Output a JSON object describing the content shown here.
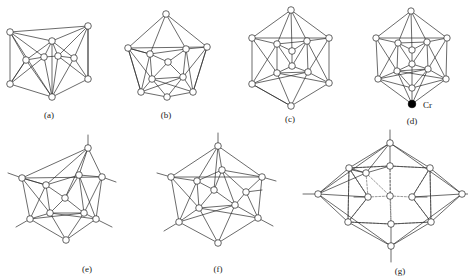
{
  "figure": {
    "kind": "polyhedral-cluster-diagram-set",
    "background_color": "#ffffff",
    "line_color": "#2b2b2b",
    "node_fill": "#ffffff",
    "node_stroke": "#222222",
    "filled_node_color": "#000000",
    "panels": [
      {
        "id": "a",
        "caption": "(a)",
        "caption_x": 49,
        "caption_y": 118,
        "vertex_count": 10,
        "has_exo_bonds": false,
        "has_dashed_bonds": false,
        "nodes": [
          {
            "x": 10,
            "y": 32,
            "r": 3.3,
            "filled": false
          },
          {
            "x": 88,
            "y": 26,
            "r": 3.3,
            "filled": false
          },
          {
            "x": 10,
            "y": 84,
            "r": 3.3,
            "filled": false
          },
          {
            "x": 88,
            "y": 79,
            "r": 3.3,
            "filled": false
          },
          {
            "x": 52,
            "y": 41,
            "r": 3.3,
            "filled": false
          },
          {
            "x": 52,
            "y": 97,
            "r": 3.3,
            "filled": false
          },
          {
            "x": 26,
            "y": 60,
            "r": 3.3,
            "filled": false
          },
          {
            "x": 74,
            "y": 58,
            "r": 3.3,
            "filled": false
          },
          {
            "x": 44,
            "y": 57,
            "r": 3.3,
            "filled": false
          },
          {
            "x": 58,
            "y": 56,
            "r": 3.3,
            "filled": false
          }
        ]
      },
      {
        "id": "b",
        "caption": "(b)",
        "caption_x": 166,
        "caption_y": 118,
        "vertex_count": 11,
        "has_exo_bonds": false,
        "has_dashed_bonds": false,
        "nodes": [
          {
            "x": 166,
            "y": 14,
            "r": 3.3,
            "filled": false
          },
          {
            "x": 128,
            "y": 48,
            "r": 3.3,
            "filled": false
          },
          {
            "x": 207,
            "y": 47,
            "r": 3.3,
            "filled": false
          },
          {
            "x": 141,
            "y": 92,
            "r": 3.3,
            "filled": false
          },
          {
            "x": 193,
            "y": 92,
            "r": 3.3,
            "filled": false
          },
          {
            "x": 150,
            "y": 54,
            "r": 3.3,
            "filled": false
          },
          {
            "x": 186,
            "y": 49,
            "r": 3.3,
            "filled": false
          },
          {
            "x": 152,
            "y": 79,
            "r": 3.3,
            "filled": false
          },
          {
            "x": 183,
            "y": 77,
            "r": 3.3,
            "filled": false
          },
          {
            "x": 168,
            "y": 62,
            "r": 3.3,
            "filled": false
          },
          {
            "x": 167,
            "y": 97,
            "r": 3.3,
            "filled": false
          }
        ]
      },
      {
        "id": "c",
        "caption": "(c)",
        "caption_x": 290,
        "caption_y": 122,
        "vertex_count": 12,
        "has_exo_bonds": false,
        "has_dashed_bonds": false,
        "nodes": [
          {
            "x": 291,
            "y": 10,
            "r": 3.3,
            "filled": false
          },
          {
            "x": 252,
            "y": 38,
            "r": 3.3,
            "filled": false
          },
          {
            "x": 329,
            "y": 38,
            "r": 3.3,
            "filled": false
          },
          {
            "x": 252,
            "y": 84,
            "r": 3.3,
            "filled": false
          },
          {
            "x": 329,
            "y": 83,
            "r": 3.3,
            "filled": false
          },
          {
            "x": 291,
            "y": 106,
            "r": 3.3,
            "filled": false
          },
          {
            "x": 277,
            "y": 44,
            "r": 3.3,
            "filled": false
          },
          {
            "x": 307,
            "y": 41,
            "r": 3.3,
            "filled": false
          },
          {
            "x": 277,
            "y": 73,
            "r": 3.3,
            "filled": false
          },
          {
            "x": 308,
            "y": 72,
            "r": 3.3,
            "filled": false
          },
          {
            "x": 292,
            "y": 51,
            "r": 3.3,
            "filled": false
          },
          {
            "x": 292,
            "y": 66,
            "r": 3.3,
            "filled": false
          }
        ]
      },
      {
        "id": "d",
        "caption": "(d)",
        "caption_x": 412,
        "caption_y": 124,
        "vertex_count": 12,
        "has_exo_bonds": false,
        "has_dashed_bonds": false,
        "metal_label": "Cr",
        "metal_label_x": 423,
        "metal_label_y": 108,
        "metal_node": {
          "x": 412,
          "y": 104,
          "r": 3.8,
          "filled": true
        },
        "nodes": [
          {
            "x": 411,
            "y": 11,
            "r": 3.2,
            "filled": false
          },
          {
            "x": 376,
            "y": 38,
            "r": 3.2,
            "filled": false
          },
          {
            "x": 447,
            "y": 38,
            "r": 3.2,
            "filled": false
          },
          {
            "x": 378,
            "y": 79,
            "r": 3.2,
            "filled": false
          },
          {
            "x": 446,
            "y": 79,
            "r": 3.2,
            "filled": false
          },
          {
            "x": 398,
            "y": 43,
            "r": 3.2,
            "filled": false
          },
          {
            "x": 427,
            "y": 42,
            "r": 3.2,
            "filled": false
          },
          {
            "x": 397,
            "y": 71,
            "r": 3.2,
            "filled": false
          },
          {
            "x": 428,
            "y": 69,
            "r": 3.2,
            "filled": false
          },
          {
            "x": 412,
            "y": 50,
            "r": 3.2,
            "filled": false
          },
          {
            "x": 412,
            "y": 64,
            "r": 3.2,
            "filled": false
          },
          {
            "x": 412,
            "y": 88,
            "r": 3.2,
            "filled": false
          }
        ]
      },
      {
        "id": "e",
        "caption": "(e)",
        "caption_x": 87,
        "caption_y": 272,
        "vertex_count": 11,
        "has_exo_bonds": true,
        "has_dashed_bonds": false,
        "nodes": [
          {
            "x": 88,
            "y": 148,
            "r": 3.3,
            "filled": false
          },
          {
            "x": 22,
            "y": 178,
            "r": 3.3,
            "filled": false
          },
          {
            "x": 102,
            "y": 177,
            "r": 3.3,
            "filled": false
          },
          {
            "x": 30,
            "y": 219,
            "r": 3.3,
            "filled": false
          },
          {
            "x": 96,
            "y": 219,
            "r": 3.3,
            "filled": false
          },
          {
            "x": 46,
            "y": 185,
            "r": 3.3,
            "filled": false
          },
          {
            "x": 79,
            "y": 175,
            "r": 3.3,
            "filled": false
          },
          {
            "x": 50,
            "y": 213,
            "r": 3.3,
            "filled": false
          },
          {
            "x": 84,
            "y": 213,
            "r": 3.3,
            "filled": false
          },
          {
            "x": 65,
            "y": 198,
            "r": 3.3,
            "filled": false
          },
          {
            "x": 66,
            "y": 240,
            "r": 3.3,
            "filled": false
          }
        ]
      },
      {
        "id": "f",
        "caption": "(f)",
        "caption_x": 218,
        "caption_y": 272,
        "vertex_count": 12,
        "has_exo_bonds": true,
        "has_dashed_bonds": false,
        "nodes": [
          {
            "x": 218,
            "y": 146,
            "r": 3.3,
            "filled": false
          },
          {
            "x": 171,
            "y": 177,
            "r": 3.3,
            "filled": false
          },
          {
            "x": 262,
            "y": 177,
            "r": 3.3,
            "filled": false
          },
          {
            "x": 179,
            "y": 222,
            "r": 3.3,
            "filled": false
          },
          {
            "x": 258,
            "y": 218,
            "r": 3.3,
            "filled": false
          },
          {
            "x": 197,
            "y": 181,
            "r": 3.3,
            "filled": false
          },
          {
            "x": 222,
            "y": 170,
            "r": 3.3,
            "filled": false
          },
          {
            "x": 199,
            "y": 208,
            "r": 3.3,
            "filled": false
          },
          {
            "x": 235,
            "y": 205,
            "r": 3.3,
            "filled": false
          },
          {
            "x": 214,
            "y": 190,
            "r": 3.3,
            "filled": false
          },
          {
            "x": 218,
            "y": 243,
            "r": 3.3,
            "filled": false
          },
          {
            "x": 246,
            "y": 192,
            "r": 3.3,
            "filled": false
          }
        ]
      },
      {
        "id": "g",
        "caption": "(g)",
        "caption_x": 400,
        "caption_y": 274,
        "vertex_count": 14,
        "has_exo_bonds": true,
        "has_dashed_bonds": true,
        "nodes": [
          {
            "x": 390,
            "y": 143,
            "r": 3.3,
            "filled": false
          },
          {
            "x": 318,
            "y": 194,
            "r": 3.3,
            "filled": false
          },
          {
            "x": 462,
            "y": 194,
            "r": 3.3,
            "filled": false
          },
          {
            "x": 391,
            "y": 246,
            "r": 3.3,
            "filled": false
          },
          {
            "x": 349,
            "y": 168,
            "r": 3.3,
            "filled": false
          },
          {
            "x": 390,
            "y": 166,
            "r": 3.3,
            "filled": false
          },
          {
            "x": 430,
            "y": 168,
            "r": 3.3,
            "filled": false
          },
          {
            "x": 348,
            "y": 222,
            "r": 3.3,
            "filled": false
          },
          {
            "x": 391,
            "y": 224,
            "r": 3.3,
            "filled": false
          },
          {
            "x": 431,
            "y": 222,
            "r": 3.3,
            "filled": false
          },
          {
            "x": 368,
            "y": 197,
            "r": 3.3,
            "filled": false
          },
          {
            "x": 412,
            "y": 197,
            "r": 3.3,
            "filled": false
          },
          {
            "x": 390,
            "y": 196,
            "r": 3.3,
            "filled": false
          },
          {
            "x": 366,
            "y": 173,
            "r": 3.3,
            "filled": false
          }
        ]
      }
    ]
  }
}
